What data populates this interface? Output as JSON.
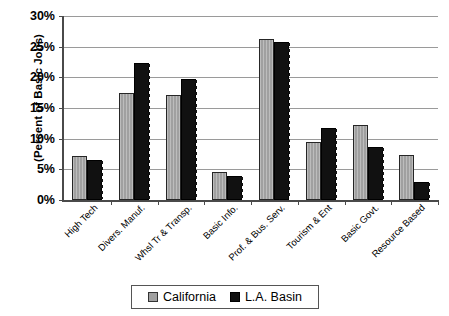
{
  "chart_data": {
    "type": "bar",
    "title": "",
    "xlabel": "",
    "ylabel": "(Percent of Basic Jobs)",
    "ylim": [
      0,
      30
    ],
    "ytick_labels": [
      "30%",
      "25%",
      "20%",
      "15%",
      "10%",
      "5%",
      "0%"
    ],
    "ytick_values": [
      30,
      25,
      20,
      15,
      10,
      5,
      0
    ],
    "grid": true,
    "legend_position": "bottom",
    "categories": [
      "High Tech",
      "Divers. Manuf.",
      "Whsl Tr & Transp.",
      "Basic Info.",
      "Prof. & Bus. Serv.",
      "Tourism & Ent",
      "Basic Govt.",
      "Resource Based"
    ],
    "series": [
      {
        "name": "California",
        "color": "#a0a0a0",
        "values": [
          7.2,
          17.5,
          17.1,
          4.6,
          26.2,
          9.4,
          12.2,
          7.4
        ]
      },
      {
        "name": "L.A. Basin",
        "color": "#111111",
        "values": [
          6.6,
          22.4,
          19.8,
          3.9,
          25.7,
          11.8,
          8.6,
          3.0
        ]
      }
    ]
  },
  "legend": {
    "items": [
      {
        "label": "California",
        "swatch": "gray-square-icon"
      },
      {
        "label": "L.A. Basin",
        "swatch": "black-square-icon"
      }
    ]
  }
}
